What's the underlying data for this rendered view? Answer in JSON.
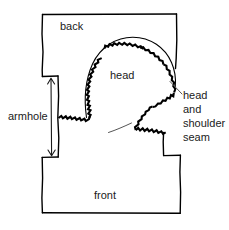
{
  "figure": {
    "type": "technical-sewing-diagram",
    "background_color": "#ffffff",
    "line_color": "#000000",
    "text_color": "#1a1a1a"
  },
  "labels": {
    "back": "back",
    "head": "head",
    "front": "front",
    "armhole": "armhole",
    "head_and_shoulder_seam": {
      "line1": "head",
      "line2": "and",
      "line3": "shoulder",
      "line4": "seam"
    }
  },
  "annotations": {
    "armhole_measure": "vertical double-headed arrow spanning the armhole opening",
    "seam_leader_line": "thin leader line pointing from the head and shoulder seam label to the seam",
    "inner_leader_curve": "thin curved leader stroke beneath the head"
  },
  "geometry": {
    "garment_outline": "stepped rectangle body with back panel on top and front panel at bottom",
    "head_curve": "domed sleeve-head cap drawn as a thin outer line paired with a bold zigzag seam line",
    "zigzag_seam": "bold serrated stitch line running along the armhole and sleeve head"
  }
}
